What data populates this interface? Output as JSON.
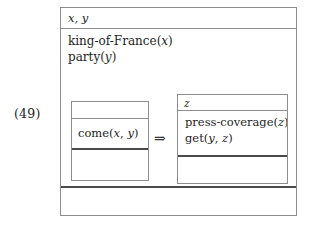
{
  "equation": {
    "number": "(49)"
  },
  "drs": {
    "outer": {
      "universe_label": "x, y",
      "conditions": [
        "king-of-France(x)",
        "party(y)"
      ],
      "footer_text": ""
    },
    "implication": {
      "symbol": "⇒",
      "symbol_name": "double-right-arrow"
    },
    "antecedent": {
      "universe_label": "",
      "conditions": [
        "come(x, y)"
      ],
      "footer_text": ""
    },
    "consequent": {
      "universe_label": "z",
      "conditions": [
        "press-coverage(z)",
        "get(y, z)"
      ],
      "footer_text": ""
    }
  },
  "colors": {
    "box_border": "#8d8d8d",
    "thick_divider": "#4a4a4a",
    "text": "#1e1e1e",
    "background": "#ffffff"
  }
}
